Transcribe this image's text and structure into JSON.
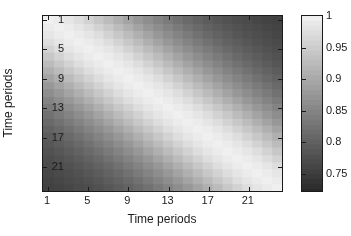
{
  "chart_data": {
    "type": "heatmap",
    "title": "",
    "xlabel": "Time periods",
    "ylabel": "Time periods",
    "xticks": [
      1,
      5,
      9,
      13,
      17,
      21
    ],
    "yticks": [
      1,
      5,
      9,
      13,
      17,
      21
    ],
    "xlim": [
      0.5,
      24.5
    ],
    "ylim": [
      0.5,
      24.5
    ],
    "n": 24,
    "colormap": "gray",
    "grid": false,
    "clim": [
      0.72,
      1.0
    ],
    "colorbar": {
      "position": "right",
      "ticks": [
        1,
        0.95,
        0.9,
        0.85,
        0.8,
        0.75
      ],
      "tick_labels": [
        "1",
        "0.95",
        "0.9",
        "0.85",
        "0.8",
        "0.75"
      ],
      "vmin": 0.72,
      "vmax": 1.0,
      "low_color": "#2e2e2e",
      "high_color": "#ececec"
    },
    "row_labels": [
      1,
      2,
      3,
      4,
      5,
      6,
      7,
      8,
      9,
      10,
      11,
      12,
      13,
      14,
      15,
      16,
      17,
      18,
      19,
      20,
      21,
      22,
      23,
      24
    ],
    "col_labels": [
      1,
      2,
      3,
      4,
      5,
      6,
      7,
      8,
      9,
      10,
      11,
      12,
      13,
      14,
      15,
      16,
      17,
      18,
      19,
      20,
      21,
      22,
      23,
      24
    ],
    "values": [
      [
        1.0,
        0.995,
        0.986,
        0.974,
        0.959,
        0.943,
        0.926,
        0.909,
        0.892,
        0.876,
        0.861,
        0.847,
        0.834,
        0.822,
        0.811,
        0.801,
        0.792,
        0.784,
        0.777,
        0.771,
        0.766,
        0.761,
        0.757,
        0.754
      ],
      [
        0.995,
        1.0,
        0.995,
        0.986,
        0.974,
        0.959,
        0.943,
        0.926,
        0.909,
        0.892,
        0.876,
        0.861,
        0.847,
        0.834,
        0.822,
        0.811,
        0.801,
        0.792,
        0.784,
        0.777,
        0.771,
        0.766,
        0.761,
        0.757
      ],
      [
        0.986,
        0.995,
        1.0,
        0.995,
        0.986,
        0.974,
        0.959,
        0.943,
        0.926,
        0.909,
        0.892,
        0.876,
        0.861,
        0.847,
        0.834,
        0.822,
        0.811,
        0.801,
        0.792,
        0.784,
        0.777,
        0.771,
        0.766,
        0.761
      ],
      [
        0.974,
        0.986,
        0.995,
        1.0,
        0.995,
        0.986,
        0.974,
        0.959,
        0.943,
        0.926,
        0.909,
        0.892,
        0.876,
        0.861,
        0.847,
        0.834,
        0.822,
        0.811,
        0.801,
        0.792,
        0.784,
        0.777,
        0.771,
        0.766
      ],
      [
        0.959,
        0.974,
        0.986,
        0.995,
        1.0,
        0.995,
        0.986,
        0.974,
        0.959,
        0.943,
        0.926,
        0.909,
        0.892,
        0.876,
        0.861,
        0.847,
        0.834,
        0.822,
        0.811,
        0.801,
        0.792,
        0.784,
        0.777,
        0.771
      ],
      [
        0.943,
        0.959,
        0.974,
        0.986,
        0.995,
        1.0,
        0.995,
        0.986,
        0.974,
        0.959,
        0.943,
        0.926,
        0.909,
        0.892,
        0.876,
        0.861,
        0.847,
        0.834,
        0.822,
        0.811,
        0.801,
        0.792,
        0.784,
        0.777
      ],
      [
        0.926,
        0.943,
        0.959,
        0.974,
        0.986,
        0.995,
        1.0,
        0.995,
        0.986,
        0.974,
        0.959,
        0.943,
        0.926,
        0.909,
        0.892,
        0.876,
        0.861,
        0.847,
        0.834,
        0.822,
        0.811,
        0.801,
        0.792,
        0.784
      ],
      [
        0.909,
        0.926,
        0.943,
        0.959,
        0.974,
        0.986,
        0.995,
        1.0,
        0.995,
        0.986,
        0.974,
        0.959,
        0.943,
        0.926,
        0.909,
        0.892,
        0.876,
        0.861,
        0.847,
        0.834,
        0.822,
        0.811,
        0.801,
        0.792
      ],
      [
        0.892,
        0.909,
        0.926,
        0.943,
        0.959,
        0.974,
        0.986,
        0.995,
        1.0,
        0.995,
        0.986,
        0.974,
        0.959,
        0.943,
        0.926,
        0.909,
        0.892,
        0.876,
        0.861,
        0.847,
        0.834,
        0.822,
        0.811,
        0.801
      ],
      [
        0.876,
        0.892,
        0.909,
        0.926,
        0.943,
        0.959,
        0.974,
        0.986,
        0.995,
        1.0,
        0.995,
        0.986,
        0.974,
        0.959,
        0.943,
        0.926,
        0.909,
        0.892,
        0.876,
        0.861,
        0.847,
        0.834,
        0.822,
        0.811
      ],
      [
        0.861,
        0.876,
        0.892,
        0.909,
        0.926,
        0.943,
        0.959,
        0.974,
        0.986,
        0.995,
        1.0,
        0.995,
        0.986,
        0.974,
        0.959,
        0.943,
        0.926,
        0.909,
        0.892,
        0.876,
        0.861,
        0.847,
        0.834,
        0.822
      ],
      [
        0.847,
        0.861,
        0.876,
        0.892,
        0.909,
        0.926,
        0.943,
        0.959,
        0.974,
        0.986,
        0.995,
        1.0,
        0.995,
        0.986,
        0.974,
        0.959,
        0.943,
        0.926,
        0.909,
        0.892,
        0.876,
        0.861,
        0.847,
        0.834
      ],
      [
        0.834,
        0.847,
        0.861,
        0.876,
        0.892,
        0.909,
        0.926,
        0.943,
        0.959,
        0.974,
        0.986,
        0.995,
        1.0,
        0.995,
        0.986,
        0.974,
        0.959,
        0.943,
        0.926,
        0.909,
        0.892,
        0.876,
        0.861,
        0.847
      ],
      [
        0.822,
        0.834,
        0.847,
        0.861,
        0.876,
        0.892,
        0.909,
        0.926,
        0.943,
        0.959,
        0.974,
        0.986,
        0.995,
        1.0,
        0.995,
        0.986,
        0.974,
        0.959,
        0.943,
        0.926,
        0.909,
        0.892,
        0.876,
        0.861
      ],
      [
        0.811,
        0.822,
        0.834,
        0.847,
        0.861,
        0.876,
        0.892,
        0.909,
        0.926,
        0.943,
        0.959,
        0.974,
        0.986,
        0.995,
        1.0,
        0.995,
        0.986,
        0.974,
        0.959,
        0.943,
        0.926,
        0.909,
        0.892,
        0.876
      ],
      [
        0.801,
        0.811,
        0.822,
        0.834,
        0.847,
        0.861,
        0.876,
        0.892,
        0.909,
        0.926,
        0.943,
        0.959,
        0.974,
        0.986,
        0.995,
        1.0,
        0.995,
        0.986,
        0.974,
        0.959,
        0.943,
        0.926,
        0.909,
        0.892
      ],
      [
        0.792,
        0.801,
        0.811,
        0.822,
        0.834,
        0.847,
        0.861,
        0.876,
        0.892,
        0.909,
        0.926,
        0.943,
        0.959,
        0.974,
        0.986,
        0.995,
        1.0,
        0.995,
        0.986,
        0.974,
        0.959,
        0.943,
        0.926,
        0.909
      ],
      [
        0.784,
        0.792,
        0.801,
        0.811,
        0.822,
        0.834,
        0.847,
        0.861,
        0.876,
        0.892,
        0.909,
        0.926,
        0.943,
        0.959,
        0.974,
        0.986,
        0.995,
        1.0,
        0.995,
        0.986,
        0.974,
        0.959,
        0.943,
        0.926
      ],
      [
        0.777,
        0.784,
        0.792,
        0.801,
        0.811,
        0.822,
        0.834,
        0.847,
        0.861,
        0.876,
        0.892,
        0.909,
        0.926,
        0.943,
        0.959,
        0.974,
        0.986,
        0.995,
        1.0,
        0.995,
        0.986,
        0.974,
        0.959,
        0.943
      ],
      [
        0.771,
        0.777,
        0.784,
        0.792,
        0.801,
        0.811,
        0.822,
        0.834,
        0.847,
        0.861,
        0.876,
        0.892,
        0.909,
        0.926,
        0.943,
        0.959,
        0.974,
        0.986,
        0.995,
        1.0,
        0.995,
        0.986,
        0.974,
        0.959
      ],
      [
        0.766,
        0.771,
        0.777,
        0.784,
        0.792,
        0.801,
        0.811,
        0.822,
        0.834,
        0.847,
        0.861,
        0.876,
        0.892,
        0.909,
        0.926,
        0.943,
        0.959,
        0.974,
        0.986,
        0.995,
        1.0,
        0.995,
        0.986,
        0.974
      ],
      [
        0.761,
        0.766,
        0.771,
        0.777,
        0.784,
        0.792,
        0.801,
        0.811,
        0.822,
        0.834,
        0.847,
        0.861,
        0.876,
        0.892,
        0.909,
        0.926,
        0.943,
        0.959,
        0.974,
        0.986,
        0.995,
        1.0,
        0.995,
        0.986
      ],
      [
        0.757,
        0.761,
        0.766,
        0.771,
        0.777,
        0.784,
        0.792,
        0.801,
        0.811,
        0.822,
        0.834,
        0.847,
        0.861,
        0.876,
        0.892,
        0.909,
        0.926,
        0.943,
        0.959,
        0.974,
        0.986,
        0.995,
        1.0,
        0.995
      ],
      [
        0.754,
        0.757,
        0.761,
        0.766,
        0.771,
        0.777,
        0.784,
        0.792,
        0.801,
        0.811,
        0.822,
        0.834,
        0.847,
        0.861,
        0.876,
        0.892,
        0.909,
        0.926,
        0.943,
        0.959,
        0.974,
        0.986,
        0.995,
        1.0
      ]
    ]
  }
}
